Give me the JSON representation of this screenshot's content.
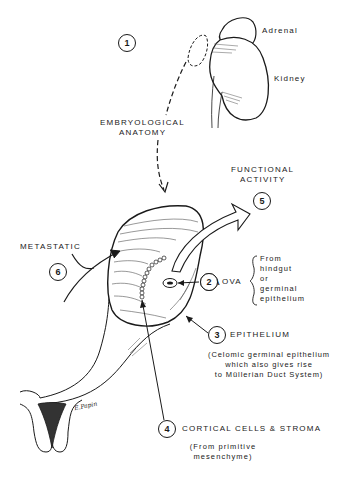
{
  "diagram": {
    "labels": {
      "adrenal": "Adrenal",
      "kidney": "Kidney",
      "embryological_line1": "EMBRYOLOGICAL",
      "embryological_line2": "ANATOMY",
      "functional_line1": "FUNCTIONAL",
      "functional_line2": "ACTIVITY",
      "metastatic": "METASTATIC",
      "ova": "OVA",
      "ova_origin": [
        "From",
        "hindgut",
        "or",
        "germinal",
        "epithelium"
      ],
      "epithelium": "EPITHELIUM",
      "epithelium_note": [
        "(Celomic germinal epithelium",
        "which also gives rise",
        "to Müllerian Duct System)"
      ],
      "cortical": "CORTICAL CELLS & STROMA",
      "cortical_note": [
        "(From primitive",
        "mesenchyme)"
      ],
      "signature": "E.Papin"
    },
    "markers": [
      "1",
      "2",
      "3",
      "4",
      "5",
      "6"
    ]
  }
}
